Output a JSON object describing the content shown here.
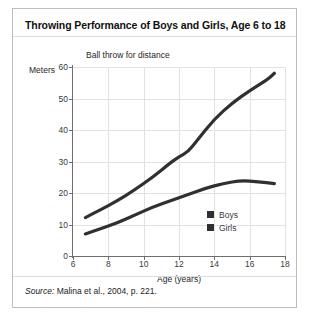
{
  "figure": {
    "title": "Throwing Performance of Boys and Girls, Age 6 to 18",
    "source_word": "Source:",
    "source_text": " Malina et al., 2004, p. 221."
  },
  "chart_data": {
    "type": "line",
    "title": "Ball throw for distance",
    "xlabel": "Age (years)",
    "ylabel": "Meters",
    "xlim": [
      6,
      18
    ],
    "ylim": [
      0,
      60
    ],
    "xticks": [
      6,
      8,
      10,
      12,
      14,
      16,
      18
    ],
    "yticks": [
      0,
      10,
      20,
      30,
      40,
      50,
      60
    ],
    "grid": true,
    "legend_position": "inside-lower-right",
    "line_color": "#303030",
    "series": [
      {
        "name": "Boys",
        "swatch_color": "#303030",
        "x": [
          6.7,
          7.5,
          8.5,
          9.5,
          10.5,
          11.5,
          12.0,
          12.5,
          13.0,
          14.0,
          15.0,
          16.0,
          17.0,
          17.4
        ],
        "values": [
          12.2,
          14.5,
          17.5,
          21.0,
          25.0,
          29.5,
          31.5,
          33.0,
          36.5,
          43.5,
          48.5,
          52.5,
          56.0,
          58.0
        ]
      },
      {
        "name": "Girls",
        "swatch_color": "#303030",
        "x": [
          6.7,
          7.5,
          8.5,
          9.5,
          10.5,
          11.5,
          12.5,
          13.5,
          14.5,
          15.5,
          16.5,
          17.4
        ],
        "values": [
          7.0,
          8.5,
          10.5,
          13.0,
          15.5,
          17.5,
          19.5,
          21.5,
          23.0,
          24.0,
          23.6,
          23.0
        ]
      }
    ]
  }
}
